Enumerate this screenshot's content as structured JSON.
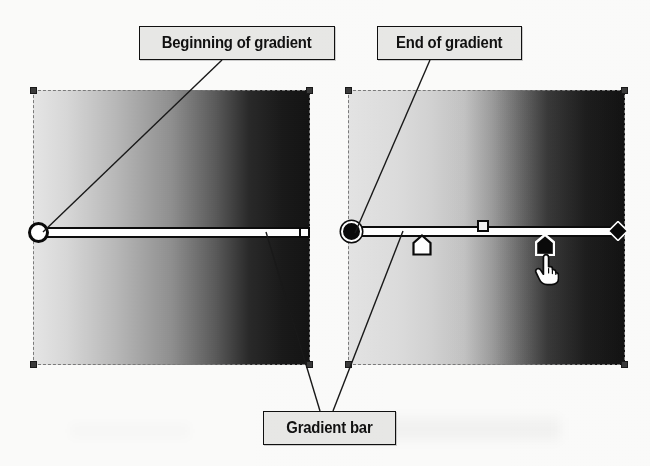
{
  "figure": {
    "background_color": "#fbfbfa"
  },
  "callouts": [
    {
      "id": "beginning-of-gradient",
      "label": "Beginning of gradient",
      "box": {
        "x": 139,
        "y": 26,
        "w": 196,
        "h": 34
      },
      "font_size": 16,
      "leader_from": {
        "x": 222,
        "y": 60
      },
      "leader_to": {
        "x": 43,
        "y": 232
      }
    },
    {
      "id": "end-of-gradient",
      "label": "End of gradient",
      "box": {
        "x": 377,
        "y": 26,
        "w": 145,
        "h": 34
      },
      "font_size": 16,
      "leader_from": {
        "x": 430,
        "y": 60
      },
      "leader_to": {
        "x": 355,
        "y": 233
      }
    },
    {
      "id": "gradient-bar",
      "label": "Gradient bar",
      "box": {
        "x": 263,
        "y": 411,
        "w": 133,
        "h": 34
      },
      "font_size": 16,
      "leaders": [
        {
          "from": {
            "x": 320,
            "y": 411
          },
          "to": {
            "x": 266,
            "y": 232
          }
        },
        {
          "from": {
            "x": 333,
            "y": 411
          },
          "to": {
            "x": 403,
            "y": 231
          }
        }
      ]
    }
  ],
  "panels": [
    {
      "id": "linear-midpoint-panel",
      "name": "left-gradient-panel",
      "x": 33,
      "y": 90,
      "w": 277,
      "h": 275,
      "gradient": {
        "type": "linear",
        "angle_deg": 90,
        "stops": [
          {
            "position": 0,
            "color": "#e6e6e6"
          },
          {
            "position": 50,
            "color": "#8f8f8f"
          },
          {
            "position": 78,
            "color": "#2a2a2a"
          },
          {
            "position": 100,
            "color": "#141414"
          }
        ],
        "midpoint_percent": 50
      },
      "bar": {
        "y": 232,
        "x_start": 43,
        "x_end": 305,
        "start_marker": "hollow-circle",
        "end_marker": "white-square",
        "midpoint_marker": null,
        "color_stops": []
      },
      "handles": [
        {
          "x": 33,
          "y": 90
        },
        {
          "x": 310,
          "y": 90
        },
        {
          "x": 33,
          "y": 365
        },
        {
          "x": 310,
          "y": 365
        }
      ]
    },
    {
      "id": "shifted-midpoint-panel",
      "name": "right-gradient-panel",
      "x": 348,
      "y": 90,
      "w": 277,
      "h": 275,
      "gradient": {
        "type": "linear",
        "angle_deg": 90,
        "stops": [
          {
            "position": 0,
            "color": "#e4e4e4"
          },
          {
            "position": 30,
            "color": "#d2d2d2"
          },
          {
            "position": 52,
            "color": "#9c9c9c"
          },
          {
            "position": 72,
            "color": "#3a3a3a"
          },
          {
            "position": 100,
            "color": "#131313"
          }
        ],
        "midpoint_percent": 58
      },
      "bar": {
        "y": 231,
        "x_start": 355,
        "x_end": 620,
        "start_marker": "filled-circle",
        "end_marker": "black-diamond",
        "midpoint_marker": {
          "type": "white-square",
          "x": 483
        },
        "color_stops": [
          {
            "id": "stop-left",
            "type": "pentagon-hollow",
            "x": 422,
            "y": 244,
            "selected": false
          },
          {
            "id": "stop-right",
            "type": "pentagon-filled",
            "x": 545,
            "y": 244,
            "selected": true
          }
        ]
      },
      "handles": [
        {
          "x": 348,
          "y": 90
        },
        {
          "x": 625,
          "y": 90
        },
        {
          "x": 348,
          "y": 365
        },
        {
          "x": 625,
          "y": 365
        }
      ],
      "cursor": {
        "type": "hand-pointer-cursor",
        "x": 539,
        "y": 254
      }
    }
  ],
  "colors": {
    "label_fill": "#e8e8e6",
    "label_border": "#111111",
    "marker_black": "#0b0b0b",
    "marker_white": "#ffffff",
    "handle": "#3b3b3b"
  }
}
